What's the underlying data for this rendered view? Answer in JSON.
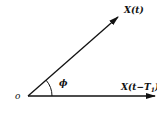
{
  "diagram": {
    "type": "phasor-angle",
    "origin_label": "o",
    "vectors": [
      {
        "label": "X(t)",
        "from": [
          28,
          96
        ],
        "to": [
          118,
          17
        ]
      },
      {
        "label_main": "X(t−T",
        "label_sub": "1",
        "label_close": ")",
        "from": [
          28,
          96
        ],
        "to": [
          156,
          96
        ]
      }
    ],
    "angle_label": "ϕ",
    "colors": {
      "stroke": "#111111",
      "background": "#ffffff"
    }
  }
}
